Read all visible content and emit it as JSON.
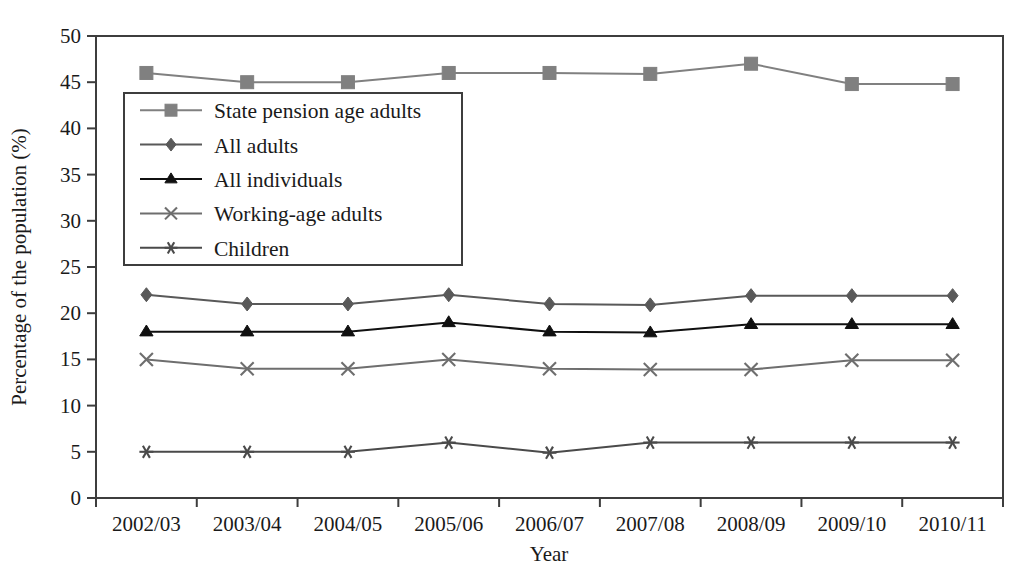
{
  "chart_data": {
    "type": "line",
    "title": "",
    "xlabel": "Year",
    "ylabel": "Percentage of the population (%)",
    "categories": [
      "2002/03",
      "2003/04",
      "2004/05",
      "2005/06",
      "2006/07",
      "2007/08",
      "2008/09",
      "2009/10",
      "2010/11"
    ],
    "ylim": [
      0,
      50
    ],
    "yticks": [
      0,
      5,
      10,
      15,
      20,
      25,
      30,
      35,
      40,
      45,
      50
    ],
    "ytick_labels": [
      "0",
      "5",
      "10",
      "15",
      "20",
      "25",
      "30",
      "35",
      "40",
      "45",
      "50"
    ],
    "grid": false,
    "legend_position": "upper-left-inside",
    "series": [
      {
        "name": "State pension age adults",
        "marker": "square",
        "color": "#808080",
        "line_color": "#808080",
        "values": [
          46,
          45,
          45,
          46,
          46,
          45.9,
          47,
          44.8,
          44.8
        ]
      },
      {
        "name": "All adults",
        "marker": "diamond",
        "color": "#595959",
        "line_color": "#595959",
        "values": [
          22,
          21,
          21,
          22,
          21,
          20.9,
          21.9,
          21.9,
          21.9
        ]
      },
      {
        "name": "All individuals",
        "marker": "triangle",
        "color": "#101010",
        "line_color": "#101010",
        "values": [
          18,
          18,
          18,
          19,
          18,
          17.9,
          18.8,
          18.8,
          18.8
        ]
      },
      {
        "name": "Working-age adults",
        "marker": "cross",
        "color": "#6e6e6e",
        "line_color": "#6e6e6e",
        "values": [
          15,
          14,
          14,
          15,
          14,
          13.9,
          13.9,
          14.9,
          14.9
        ]
      },
      {
        "name": "Children",
        "marker": "asterisk",
        "color": "#4a4a4a",
        "line_color": "#4a4a4a",
        "values": [
          5,
          5,
          5,
          6,
          4.9,
          6,
          6,
          6,
          6
        ]
      }
    ]
  },
  "legend": {
    "entries": [
      {
        "label": "State pension age adults"
      },
      {
        "label": "All adults"
      },
      {
        "label": "All individuals"
      },
      {
        "label": "Working-age adults"
      },
      {
        "label": "Children"
      }
    ]
  },
  "axes": {
    "y_title": "Percentage of the population (%)",
    "x_title": "Year"
  }
}
